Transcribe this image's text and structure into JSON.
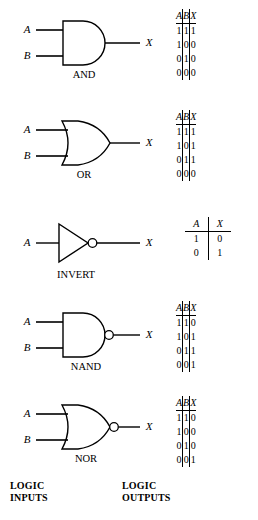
{
  "figure": {
    "background_color": "#ffffff",
    "line_color": "#000000",
    "input_labels": {
      "a": "A",
      "b": "B"
    },
    "output_label": "X"
  },
  "gates": [
    {
      "name": "AND",
      "label": "AND",
      "shape": "and",
      "inverted_output": false,
      "inputs": [
        "A",
        "B"
      ],
      "output": "X",
      "truth_table": {
        "headers": [
          "A",
          "B",
          "X"
        ],
        "rows": [
          [
            "1",
            "1",
            "1"
          ],
          [
            "1",
            "0",
            "0"
          ],
          [
            "0",
            "1",
            "0"
          ],
          [
            "0",
            "0",
            "0"
          ]
        ]
      }
    },
    {
      "name": "OR",
      "label": "OR",
      "shape": "or",
      "inverted_output": false,
      "inputs": [
        "A",
        "B"
      ],
      "output": "X",
      "truth_table": {
        "headers": [
          "A",
          "B",
          "X"
        ],
        "rows": [
          [
            "1",
            "1",
            "1"
          ],
          [
            "1",
            "0",
            "1"
          ],
          [
            "0",
            "1",
            "1"
          ],
          [
            "0",
            "0",
            "0"
          ]
        ]
      }
    },
    {
      "name": "INVERT",
      "label": "INVERT",
      "shape": "inverter",
      "inverted_output": true,
      "inputs": [
        "A"
      ],
      "output": "X",
      "truth_table": {
        "headers": [
          "A",
          "X"
        ],
        "rows": [
          [
            "1",
            "0"
          ],
          [
            "0",
            "1"
          ]
        ]
      }
    },
    {
      "name": "NAND",
      "label": "NAND",
      "shape": "and",
      "inverted_output": true,
      "inputs": [
        "A",
        "B"
      ],
      "output": "X",
      "truth_table": {
        "headers": [
          "A",
          "B",
          "X"
        ],
        "rows": [
          [
            "1",
            "1",
            "0"
          ],
          [
            "1",
            "0",
            "1"
          ],
          [
            "0",
            "1",
            "1"
          ],
          [
            "0",
            "0",
            "1"
          ]
        ]
      }
    },
    {
      "name": "NOR",
      "label": "NOR",
      "shape": "or",
      "inverted_output": true,
      "inputs": [
        "A",
        "B"
      ],
      "output": "X",
      "truth_table": {
        "headers": [
          "A",
          "B",
          "X"
        ],
        "rows": [
          [
            "1",
            "1",
            "0"
          ],
          [
            "1",
            "0",
            "0"
          ],
          [
            "0",
            "1",
            "0"
          ],
          [
            "0",
            "0",
            "1"
          ]
        ]
      }
    }
  ],
  "captions": {
    "inputs": {
      "line1": "LOGIC",
      "line2": "INPUTS"
    },
    "outputs": {
      "line1": "LOGIC",
      "line2": "OUTPUTS"
    }
  }
}
